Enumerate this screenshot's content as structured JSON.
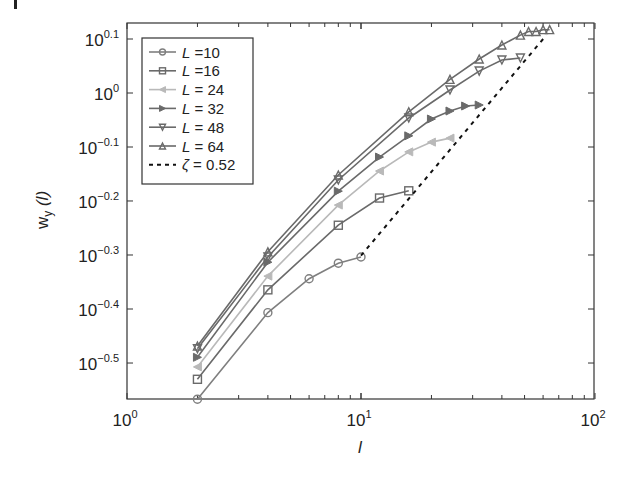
{
  "chart_data": {
    "type": "line",
    "title": "",
    "xlabel": "l",
    "ylabel": "w_y (l)",
    "xscale": "log",
    "yscale": "log",
    "xlim": [
      1,
      100
    ],
    "ylim": [
      0.27,
      1.33
    ],
    "x_ticks": [
      {
        "value": 1,
        "base": "10",
        "exp": "0"
      },
      {
        "value": 10,
        "base": "10",
        "exp": "1"
      },
      {
        "value": 100,
        "base": "10",
        "exp": "2"
      }
    ],
    "y_ticks": [
      {
        "value": 1.2589,
        "base": "10",
        "exp": "0.1"
      },
      {
        "value": 1.0,
        "base": "10",
        "exp": "0"
      },
      {
        "value": 0.7943,
        "base": "10",
        "exp": "−0.1"
      },
      {
        "value": 0.631,
        "base": "10",
        "exp": "−0.2"
      },
      {
        "value": 0.5012,
        "base": "10",
        "exp": "−0.3"
      },
      {
        "value": 0.3981,
        "base": "10",
        "exp": "−0.4"
      },
      {
        "value": 0.3162,
        "base": "10",
        "exp": "−0.5"
      }
    ],
    "grid": false,
    "legend_position": "upper left",
    "series": [
      {
        "name": "L =10",
        "marker": "circle",
        "color": "#7f7f7f",
        "x": [
          2,
          4,
          6,
          8,
          10
        ],
        "y": [
          0.271,
          0.392,
          0.453,
          0.484,
          0.497
        ]
      },
      {
        "name": "L =16",
        "marker": "square",
        "color": "#6a6a6a",
        "x": [
          2,
          4,
          8,
          12,
          16
        ],
        "y": [
          0.295,
          0.432,
          0.569,
          0.639,
          0.659
        ]
      },
      {
        "name": "L = 24",
        "marker": "triangle-left",
        "color": "#b9b9b9",
        "x": [
          2,
          4,
          8,
          12,
          16,
          20,
          24
        ],
        "y": [
          0.311,
          0.458,
          0.62,
          0.717,
          0.778,
          0.811,
          0.825
        ]
      },
      {
        "name": "L = 32",
        "marker": "triangle-right",
        "color": "#6a6a6a",
        "x": [
          2,
          4,
          8,
          12,
          16,
          20,
          24,
          28,
          32
        ],
        "y": [
          0.324,
          0.486,
          0.658,
          0.761,
          0.833,
          0.895,
          0.926,
          0.946,
          0.95
        ]
      },
      {
        "name": "L = 48",
        "marker": "triangle-down",
        "color": "#6a6a6a",
        "x": [
          2,
          4,
          8,
          16,
          24,
          32,
          40,
          48
        ],
        "y": [
          0.336,
          0.497,
          0.69,
          0.899,
          1.013,
          1.098,
          1.151,
          1.161
        ]
      },
      {
        "name": "L = 64",
        "marker": "triangle-up",
        "color": "#6a6a6a",
        "x": [
          2,
          4,
          8,
          16,
          24,
          32,
          40,
          48,
          52,
          56,
          60,
          64
        ],
        "y": [
          0.34,
          0.508,
          0.705,
          0.923,
          1.06,
          1.156,
          1.227,
          1.28,
          1.3,
          1.3,
          1.31,
          1.31
        ]
      },
      {
        "name": "ζ = 0.52",
        "marker": "none",
        "dashed": true,
        "color": "#111111",
        "x": [
          10,
          62
        ],
        "y": [
          0.5,
          1.28
        ]
      }
    ]
  },
  "labels": {
    "xlabel": "l",
    "ylabel_main": "w",
    "ylabel_sub": "y",
    "ylabel_arg": " (l)"
  }
}
